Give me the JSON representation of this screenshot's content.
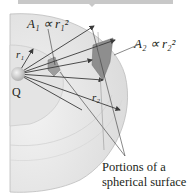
{
  "diagram": {
    "title_bar": {
      "color": "#c8c8c8"
    },
    "labels": {
      "a1": "A₁ ∝ r₁²",
      "a2": "A₂ ∝ r₂²",
      "r1": "r₁",
      "r2": "r₂",
      "charge": "Q",
      "caption_line1": "Portions of a",
      "caption_line2": "spherical surface"
    },
    "colors": {
      "sphere_fill": "#ececec",
      "inner_sphere": "#e2e2e2",
      "patch": "#9a9a9a",
      "arrow": "#3a3a3a",
      "text": "#231f20"
    }
  }
}
